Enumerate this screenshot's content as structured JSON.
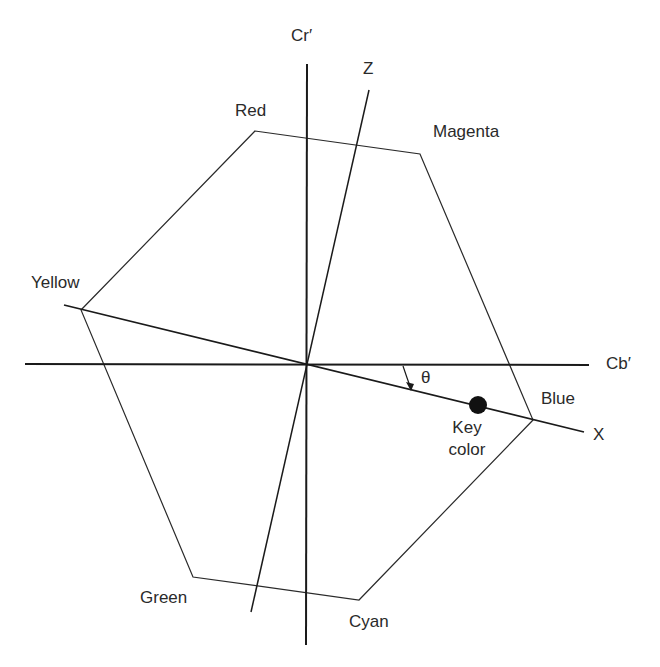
{
  "diagram": {
    "axes": {
      "vertical": "Cr′",
      "horizontal": "Cb′",
      "rotated_x": "X",
      "rotated_z": "Z"
    },
    "vertices": {
      "red": "Red",
      "magenta": "Magenta",
      "yellow": "Yellow",
      "blue": "Blue",
      "green": "Green",
      "cyan": "Cyan"
    },
    "angle_label": "θ",
    "key_color_line1": "Key",
    "key_color_line2": "color",
    "colors": {
      "line": "#2a2a2a",
      "background": "#ffffff"
    }
  }
}
